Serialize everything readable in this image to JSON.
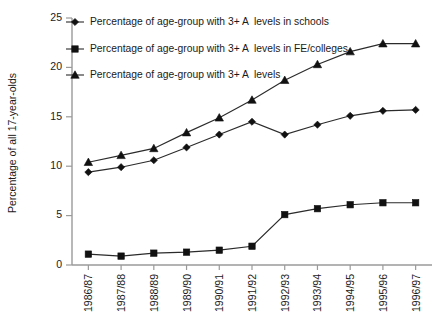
{
  "chart_data": {
    "type": "line",
    "title": "",
    "xlabel": "",
    "ylabel": "Percentage of all 17-year-olds",
    "ylim": [
      0,
      25
    ],
    "yticks": [
      0,
      5,
      10,
      15,
      20,
      25
    ],
    "grid": false,
    "legend_position": "top-left-inside",
    "categories": [
      "1986/87",
      "1987/88",
      "1988/89",
      "1989/90",
      "1990/91",
      "1991/92",
      "1992/93",
      "1993/94",
      "1994/95",
      "1995/96",
      "1996/97"
    ],
    "series": [
      {
        "name": "Percentage of age-group with 3+ A  levels in schools",
        "marker": "diamond",
        "color": "#111111",
        "values": [
          9.4,
          9.9,
          10.6,
          11.9,
          13.2,
          14.5,
          13.2,
          14.2,
          15.1,
          15.6,
          15.7
        ]
      },
      {
        "name": "Percentage of age-group with 3+ A  levels in FE/colleges",
        "marker": "square",
        "color": "#111111",
        "values": [
          1.1,
          0.9,
          1.2,
          1.3,
          1.5,
          1.9,
          5.1,
          5.7,
          6.1,
          6.3,
          6.3
        ]
      },
      {
        "name": "Percentage of age-group with 3+ A  levels",
        "marker": "triangle",
        "color": "#111111",
        "values": [
          10.4,
          11.1,
          11.8,
          13.4,
          14.9,
          16.7,
          18.7,
          20.3,
          21.6,
          22.4,
          22.4
        ]
      }
    ]
  },
  "axes": {
    "y_title": "Percentage of all 17-year-olds",
    "y_tick_labels": [
      "0",
      "5",
      "10",
      "15",
      "20",
      "25"
    ],
    "x_tick_labels": [
      "1986/87",
      "1987/88",
      "1988/89",
      "1989/90",
      "1990/91",
      "1991/92",
      "1992/93",
      "1993/94",
      "1994/95",
      "1995/96",
      "1996/97"
    ]
  },
  "legend": {
    "entries": [
      {
        "label": "Percentage of age-group with 3+ A  levels in schools",
        "marker": "diamond"
      },
      {
        "label": "Percentage of age-group with 3+ A  levels in FE/colleges",
        "marker": "square"
      },
      {
        "label": "Percentage of age-group with 3+ A  levels",
        "marker": "triangle"
      }
    ]
  },
  "colors": {
    "ink": "#111111",
    "axis": "#9a9a9a",
    "line": "#2b2b2b",
    "background": "#ffffff"
  }
}
